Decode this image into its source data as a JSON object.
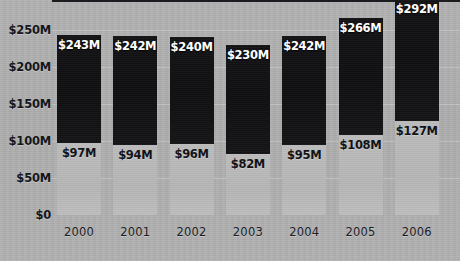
{
  "chart_data": {
    "type": "bar",
    "subtype": "stacked-bar",
    "title": "",
    "xlabel": "",
    "ylabel": "",
    "ylim": [
      0,
      292
    ],
    "y_axis_ticks": [
      "$0",
      "$50M",
      "$100M",
      "$150M",
      "$200M",
      "$250M"
    ],
    "y_axis_tick_values": [
      0,
      50,
      100,
      150,
      200,
      250
    ],
    "grid": true,
    "legend": "none",
    "categories": [
      "2000",
      "2001",
      "2002",
      "2003",
      "2004",
      "2005",
      "2006"
    ],
    "series": [
      {
        "name": "lower-segment",
        "values": [
          97,
          94,
          96,
          82,
          95,
          108,
          127
        ],
        "labels": [
          "$97M",
          "$94M",
          "$96M",
          "$82M",
          "$95M",
          "$108M",
          "$127M"
        ],
        "color": "#b8b8b8",
        "label_color": "#121318"
      },
      {
        "name": "upper-segment",
        "values": [
          146,
          148,
          144,
          148,
          147,
          158,
          165
        ],
        "totals": [
          243,
          242,
          240,
          230,
          242,
          266,
          292
        ],
        "labels": [
          "$243M",
          "$242M",
          "$240M",
          "$230M",
          "$242M",
          "$266M",
          "$292M"
        ],
        "color": "#131316",
        "label_color": "#ffffff"
      }
    ],
    "bars": [
      {
        "category": "2000",
        "total": 243,
        "total_label": "$243M",
        "lower": 97,
        "lower_label": "$97M"
      },
      {
        "category": "2001",
        "total": 242,
        "total_label": "$242M",
        "lower": 94,
        "lower_label": "$94M"
      },
      {
        "category": "2002",
        "total": 240,
        "total_label": "$240M",
        "lower": 96,
        "lower_label": "$96M"
      },
      {
        "category": "2003",
        "total": 230,
        "total_label": "$230M",
        "lower": 82,
        "lower_label": "$82M"
      },
      {
        "category": "2004",
        "total": 242,
        "total_label": "$242M",
        "lower": 95,
        "lower_label": "$95M"
      },
      {
        "category": "2005",
        "total": 266,
        "total_label": "$266M",
        "lower": 108,
        "lower_label": "$108M"
      },
      {
        "category": "2006",
        "total": 292,
        "total_label": "$292M",
        "lower": 127,
        "lower_label": "$127M"
      }
    ]
  },
  "colors": {
    "background": "#b0b0b0",
    "bar_dark": "#131316",
    "bar_light": "#b8b8b8",
    "axis": "#1b1c20",
    "gridline": "#c4c4c4",
    "text_dark": "#15161a",
    "text_light": "#ffffff"
  }
}
